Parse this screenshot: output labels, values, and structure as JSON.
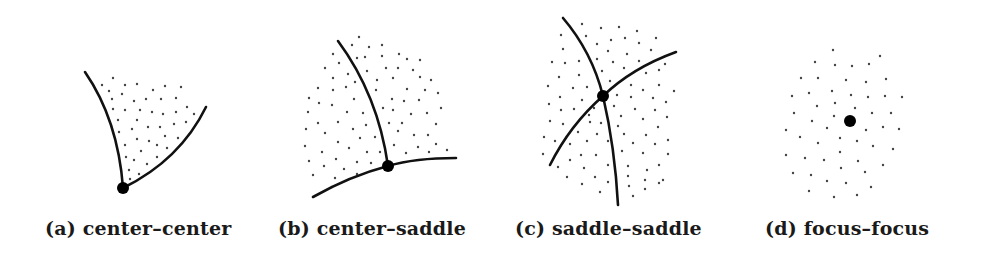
{
  "figure": {
    "panels": [
      {
        "id": "a",
        "label": "(a)",
        "title": "center–center",
        "caption_x": 45
      },
      {
        "id": "b",
        "label": "(b)",
        "title": "center–saddle",
        "caption_x": 278
      },
      {
        "id": "c",
        "label": "(c)",
        "title": "saddle–saddle",
        "caption_x": 515
      },
      {
        "id": "d",
        "label": "(d)",
        "title": "focus–focus",
        "caption_x": 765
      }
    ],
    "captions": {
      "a": "(a) center–center",
      "b": "(b) center–saddle",
      "c": "(c) saddle–saddle",
      "d": "(d) focus–focus"
    },
    "colors": {
      "ink": "#111111",
      "dots": "#444444",
      "background": "#ffffff"
    }
  }
}
